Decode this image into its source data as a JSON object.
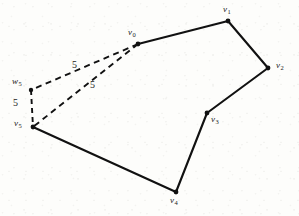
{
  "figure": {
    "type": "geometry-diagram",
    "width": 299,
    "height": 216,
    "background_color": "#fdfdfb",
    "ink_color": "#111111"
  },
  "vertices": [
    {
      "id": "v0",
      "label": "v",
      "subscript": "0",
      "x": 138,
      "y": 44,
      "label_x": 128,
      "label_y": 28,
      "kind": "polygon-vertex"
    },
    {
      "id": "v1",
      "label": "v",
      "subscript": "1",
      "x": 228,
      "y": 21,
      "label_x": 223,
      "label_y": 5,
      "kind": "polygon-vertex"
    },
    {
      "id": "v2",
      "label": "v",
      "subscript": "2",
      "x": 268,
      "y": 68,
      "label_x": 276,
      "label_y": 61,
      "kind": "polygon-vertex"
    },
    {
      "id": "v3",
      "label": "v",
      "subscript": "3",
      "x": 207,
      "y": 113,
      "label_x": 211,
      "label_y": 115,
      "kind": "polygon-vertex"
    },
    {
      "id": "v4",
      "label": "v",
      "subscript": "4",
      "x": 176,
      "y": 192,
      "label_x": 170,
      "label_y": 196,
      "kind": "polygon-vertex"
    },
    {
      "id": "v5",
      "label": "v",
      "subscript": "5",
      "x": 33,
      "y": 127,
      "label_x": 14,
      "label_y": 119,
      "kind": "polygon-vertex"
    },
    {
      "id": "w5",
      "label": "w",
      "subscript": "5",
      "x": 31,
      "y": 90,
      "label_x": 12,
      "label_y": 77,
      "kind": "auxiliary-point"
    }
  ],
  "solid_edges": [
    {
      "id": "edge-v0-v1",
      "from": "v0",
      "to": "v1"
    },
    {
      "id": "edge-v1-v2",
      "from": "v1",
      "to": "v2"
    },
    {
      "id": "edge-v2-v3",
      "from": "v2",
      "to": "v3"
    },
    {
      "id": "edge-v3-v4",
      "from": "v3",
      "to": "v4"
    },
    {
      "id": "edge-v4-v5",
      "from": "v4",
      "to": "v5"
    }
  ],
  "dashed_edges": [
    {
      "id": "dashed-v0-w5",
      "from": "v0",
      "to": "w5",
      "label": "5",
      "label_x": 72,
      "label_y": 60
    },
    {
      "id": "dashed-v0-v5",
      "from": "v0",
      "to": "v5",
      "label": "5",
      "label_x": 90,
      "label_y": 80
    },
    {
      "id": "dashed-w5-v5",
      "from": "w5",
      "to": "v5",
      "label": "5",
      "label_x": 13,
      "label_y": 98
    }
  ],
  "edge_labels": [
    {
      "id": "label-5-upper",
      "text": "5"
    },
    {
      "id": "label-5-lower",
      "text": "5"
    },
    {
      "id": "label-5-left",
      "text": "5"
    }
  ]
}
